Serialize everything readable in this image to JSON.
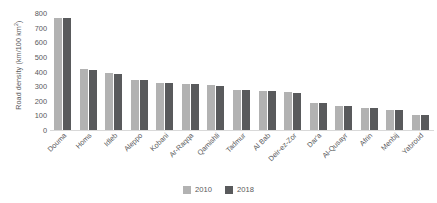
{
  "chart_data": {
    "type": "bar",
    "title": "",
    "xlabel": "",
    "ylabel": "Road density (km/100 km²)",
    "ylabel_base": "Road density (km/100 km",
    "ylabel_exp": "2",
    "ylabel_tail": ")",
    "ylim": [
      0,
      800
    ],
    "ytick_step": 100,
    "yticks": [
      "800",
      "700",
      "600",
      "500",
      "400",
      "300",
      "200",
      "100",
      "0"
    ],
    "ytick_values": [
      800,
      700,
      600,
      500,
      400,
      300,
      200,
      100,
      0
    ],
    "grid": false,
    "legend_position": "bottom-center",
    "categories": [
      "Douma",
      "Homs",
      "Idleb",
      "Aleppo",
      "Kobani",
      "Ar-Raqqa",
      "Qamishli",
      "Tadmur",
      "Al Bab",
      "Deir-ez-Zor",
      "Dar'a",
      "Al-Qusayr",
      "Afrin",
      "Menbij",
      "Yabroud"
    ],
    "series": [
      {
        "name": "2010",
        "color": "#b2b2b2",
        "values": [
          765,
          415,
          390,
          343,
          322,
          314,
          305,
          272,
          268,
          262,
          185,
          166,
          152,
          138,
          105
        ]
      },
      {
        "name": "2018",
        "color": "#595a5c",
        "values": [
          763,
          408,
          383,
          340,
          320,
          313,
          303,
          272,
          266,
          253,
          182,
          162,
          151,
          138,
          106
        ]
      }
    ]
  },
  "legend": {
    "items": [
      {
        "label": "2010",
        "color": "#b2b2b2"
      },
      {
        "label": "2018",
        "color": "#595a5c"
      }
    ]
  }
}
